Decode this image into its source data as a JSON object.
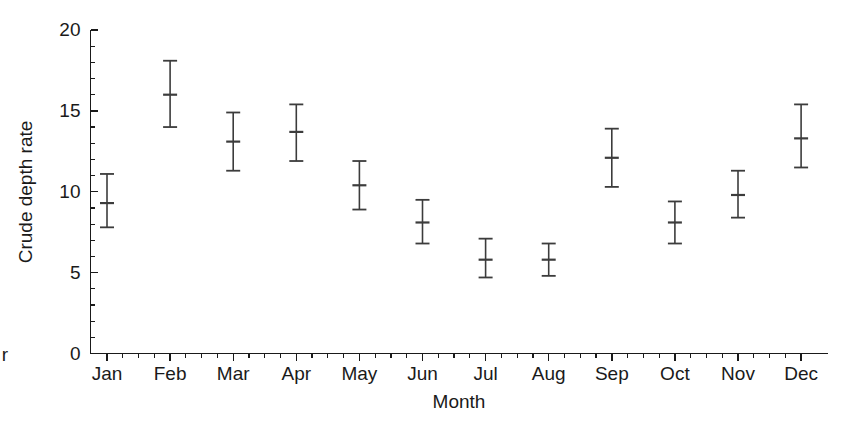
{
  "chart_data": {
    "type": "scatter",
    "title": "",
    "subtitle": "",
    "xlabel": "Month",
    "ylabel": "Crude depth rate",
    "categories": [
      "Jan",
      "Feb",
      "Mar",
      "Apr",
      "May",
      "Jun",
      "Jul",
      "Aug",
      "Sep",
      "Oct",
      "Nov",
      "Dec"
    ],
    "values": [
      9.3,
      16.0,
      13.1,
      13.7,
      10.4,
      8.1,
      5.8,
      5.8,
      12.1,
      8.1,
      9.8,
      13.3
    ],
    "error_low": [
      7.8,
      14.0,
      11.3,
      11.9,
      8.9,
      6.8,
      4.7,
      4.8,
      10.3,
      6.8,
      8.4,
      11.5
    ],
    "error_high": [
      11.1,
      18.1,
      14.9,
      15.4,
      11.9,
      9.5,
      7.1,
      6.8,
      13.9,
      9.4,
      11.3,
      15.4
    ],
    "ylim": [
      0,
      20
    ],
    "yticks": [
      0,
      5,
      10,
      15,
      20
    ],
    "ytick_labels": [
      "0",
      "5",
      "10",
      "15",
      "20"
    ],
    "yminor_step": 1,
    "grid": false,
    "legend": null,
    "legend_position": "none",
    "marker": "error-bar-with-center-tick",
    "colors": {
      "axis": "#1a1a1a",
      "marker": "#3c3c3c",
      "background": "#ffffff"
    }
  },
  "annotations": {
    "stray_left_text": "r"
  }
}
